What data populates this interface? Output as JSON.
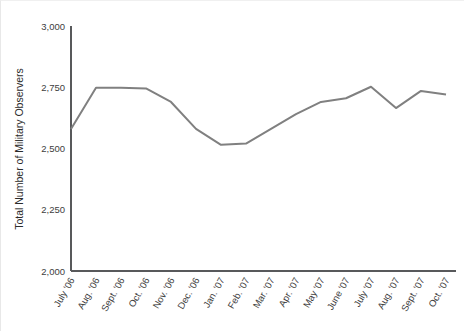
{
  "chart_data": {
    "type": "line",
    "title": "",
    "xlabel": "",
    "ylabel": "Total Number of Military Observers",
    "ylim": [
      2000,
      3000
    ],
    "yticks": [
      2000,
      2250,
      2500,
      2750,
      3000
    ],
    "ytick_labels": [
      "2,000",
      "2,250",
      "2,500",
      "2,750",
      "3,000"
    ],
    "grid": false,
    "legend": false,
    "legend_position": "none",
    "line_color": "#808080",
    "axis_color": "#58595b",
    "categories": [
      "July '06",
      "Aug. '06",
      "Sept. '06",
      "Oct. '06",
      "Nov. '06",
      "Dec. '06",
      "Jan. '07",
      "Feb. '07",
      "Mar. '07",
      "Apr. '07",
      "May '07",
      "June '07",
      "July '07",
      "Aug. '07",
      "Sept. '07",
      "Oct. '07"
    ],
    "values": [
      2580,
      2748,
      2748,
      2745,
      2690,
      2580,
      2515,
      2520,
      2580,
      2640,
      2690,
      2705,
      2752,
      2665,
      2735,
      2720
    ]
  },
  "plot": {
    "x_start": 70,
    "x_step": 25,
    "y_axis_x": 70,
    "y_top_px": 25,
    "y_bottom_px": 270
  }
}
